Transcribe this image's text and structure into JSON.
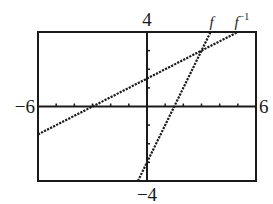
{
  "chart_data": {
    "type": "line",
    "title": "",
    "xlabel": "",
    "ylabel": "",
    "xlim": [
      -6,
      6
    ],
    "ylim": [
      -4,
      4
    ],
    "x_tick_step": 1,
    "y_tick_step": 1,
    "grid": false,
    "window_labels": {
      "xmin": "−6",
      "xmax": "6",
      "ymin": "−4",
      "ymax": "4"
    },
    "series": [
      {
        "name": "f",
        "label": "f",
        "equation": "y = 2x - 3",
        "slope": 2,
        "intercept": -3,
        "style": "dotted",
        "x": [
          -0.5,
          3.5
        ],
        "y": [
          -4,
          4
        ]
      },
      {
        "name": "f_inverse",
        "label": "f",
        "label_superscript": "−1",
        "equation": "y = (x + 3) / 2",
        "slope": 0.5,
        "intercept": 1.5,
        "style": "dotted",
        "x": [
          -6,
          5
        ],
        "y": [
          -1.5,
          4
        ]
      }
    ],
    "annotations": [
      {
        "text": "f",
        "near": "top of steep line"
      },
      {
        "text": "f⁻¹",
        "near": "top of shallow line"
      }
    ],
    "legend": "none (inline curve labels)"
  }
}
